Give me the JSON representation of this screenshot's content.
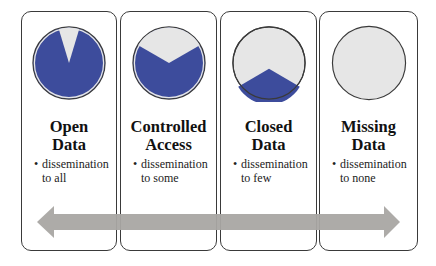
{
  "colors": {
    "blue": "#3d4c9c",
    "light": "#e6e6e6",
    "arrow": "#a9a6a3",
    "border": "#3a3a3a"
  },
  "categories": [
    {
      "title_line1": "Open",
      "title_line2": "Data",
      "bullet_line1": "dissemination",
      "bullet_line2": "to all",
      "blue_share": "~92%"
    },
    {
      "title_line1": "Controlled",
      "title_line2": "Access",
      "bullet_line1": "dissemination",
      "bullet_line2": "to some",
      "blue_share": "~67%"
    },
    {
      "title_line1": "Closed",
      "title_line2": "Data",
      "bullet_line1": "dissemination",
      "bullet_line2": "to few",
      "blue_share": "~33%"
    },
    {
      "title_line1": "Missing",
      "title_line2": "Data",
      "bullet_line1": "dissemination",
      "bullet_line2": "to none",
      "blue_share": "0%"
    }
  ],
  "bullet_symbol": "•",
  "arrow": {
    "direction": "bidirectional"
  }
}
